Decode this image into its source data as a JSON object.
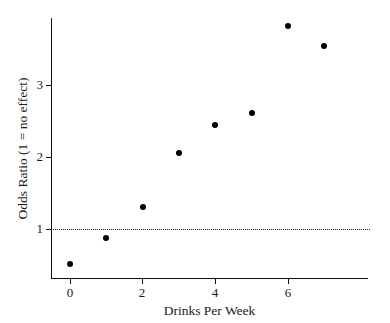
{
  "chart_data": {
    "type": "scatter",
    "title": "",
    "xlabel": "Drinks Per Week",
    "ylabel": "Odds Ratio (1 = no effect)",
    "x": [
      0,
      1,
      2,
      3,
      4,
      5,
      6,
      7
    ],
    "values": [
      0.51,
      0.88,
      1.31,
      2.06,
      2.44,
      2.61,
      3.82,
      3.54
    ],
    "series": [
      {
        "name": "Odds Ratio",
        "x": [
          0,
          1,
          2,
          3,
          4,
          5,
          6,
          7
        ],
        "values": [
          0.51,
          0.88,
          1.31,
          2.06,
          2.44,
          2.61,
          3.82,
          3.54
        ]
      }
    ],
    "xlim": [
      -0.45,
      7.75
    ],
    "ylim": [
      0.31,
      4.6
    ],
    "xticks": [
      0,
      2,
      4,
      6
    ],
    "xtick_labels": [
      "0",
      "2",
      "4",
      "6"
    ],
    "yticks": [
      1,
      2,
      3
    ],
    "ytick_labels": [
      "1",
      "2",
      "3"
    ],
    "grid": false,
    "legend": null,
    "annotations": [
      {
        "type": "reference-line",
        "orientation": "horizontal",
        "value": 1,
        "style": "dotted",
        "color": "#1a1a1a",
        "label": "1 = no effect"
      }
    ],
    "marker": {
      "shape": "circle",
      "color": "#000000",
      "size": 6
    },
    "axis_color": "#111111",
    "background": "#ffffff"
  }
}
